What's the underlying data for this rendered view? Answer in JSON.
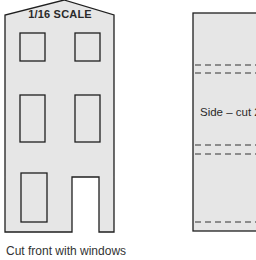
{
  "colors": {
    "panel_fill": "#e6e6e6",
    "outline": "#1f1f1f",
    "background": "#ffffff",
    "text": "#2a2a2a"
  },
  "front_panel": {
    "scale_label": "1/16 SCALE",
    "outline_points": "5,232 5,15 64,0 114,15 114,232 99,232 99,177 72,177 72,232",
    "windows": [
      {
        "name": "window-upper-left",
        "x": 20,
        "y": 33,
        "w": 25,
        "h": 28
      },
      {
        "name": "window-upper-right",
        "x": 75,
        "y": 33,
        "w": 25,
        "h": 28
      },
      {
        "name": "window-middle-left",
        "x": 20,
        "y": 95,
        "w": 25,
        "h": 47
      },
      {
        "name": "window-middle-right",
        "x": 75,
        "y": 95,
        "w": 25,
        "h": 47
      },
      {
        "name": "window-lower-left",
        "x": 21,
        "y": 173,
        "w": 26,
        "h": 49
      }
    ],
    "door_cutout": {
      "x": 72,
      "y": 177,
      "w": 27,
      "h": 55
    }
  },
  "side_panel": {
    "label": "Side – cut 2",
    "x": 193,
    "y": 13,
    "w": 70,
    "h": 218,
    "fold_lines_y": [
      65,
      73,
      145,
      154,
      222
    ]
  },
  "caption": "Cut front with windows"
}
